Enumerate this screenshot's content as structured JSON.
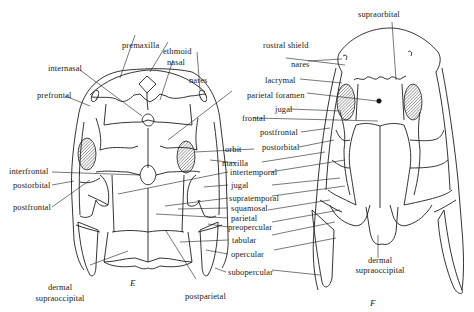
{
  "figure": {
    "panels": [
      {
        "id": "E",
        "letter": "E",
        "labels": {
          "premaxilla": "premaxilla",
          "ethmoid": "ethmoid",
          "internasal": "internasal",
          "nasal": "nasal",
          "nares": "nares",
          "prefrontal": "prefrontal",
          "interfrontal": "interfrontal",
          "postorbital": "postorbital",
          "postfrontal": "postfrontal",
          "dermal_supraoccipital": [
            "dermal",
            "supraoccipital"
          ],
          "postparietal": "postparietal"
        }
      },
      {
        "id": "F",
        "letter": "F",
        "labels": {
          "supraorbital": "supraorbital",
          "rostral_shield": "rostral shield",
          "nares": "nares",
          "dermal_supraoccipital": [
            "dermal",
            "supraoccipital"
          ]
        }
      }
    ],
    "shared_labels": {
      "lacrymal": "lacrymal",
      "parietal_foramen": "parietal foramen",
      "jugal_top": "jugal",
      "frontal": "frontal",
      "postfrontal": "postfrontal",
      "postorbital": "postorbital",
      "orbit": "orbit",
      "maxilla": "maxilla",
      "intertemporal": "intertemporal",
      "jugal": "jugal",
      "supratemporal": "supratemporal",
      "squamosal": "squamosal",
      "parietal": "parietal",
      "preopercular": "preopercular",
      "tabular": "tabular",
      "opercular": "opercular",
      "subopercular": "subopercular"
    }
  }
}
